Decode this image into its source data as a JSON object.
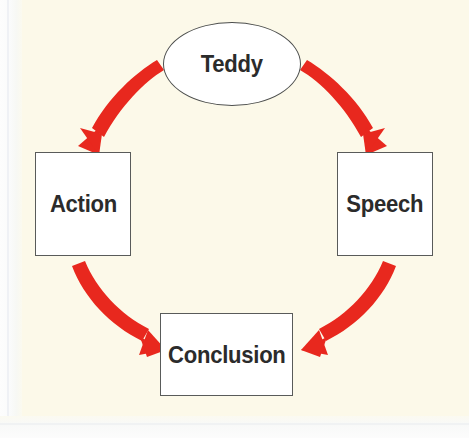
{
  "diagram": {
    "background_color": "#fcf9e9",
    "arrow_color": "#e8281e",
    "node_border_color": "#595b5a",
    "node_fill_color": "#ffffff",
    "label_color": "#2b2b2b",
    "nodes": [
      {
        "id": "teddy",
        "label": "Teddy",
        "shape": "ellipse",
        "x": 163,
        "y": 22,
        "w": 138,
        "h": 84
      },
      {
        "id": "action",
        "label": "Action",
        "shape": "rectangle",
        "x": 35,
        "y": 152,
        "w": 96,
        "h": 104
      },
      {
        "id": "speech",
        "label": "Speech",
        "shape": "rectangle",
        "x": 337,
        "y": 152,
        "w": 96,
        "h": 104
      },
      {
        "id": "conclusion",
        "label": "Conclusion",
        "shape": "rectangle",
        "x": 160,
        "y": 313,
        "w": 133,
        "h": 83
      }
    ],
    "edges": [
      {
        "id": "teddy-to-action",
        "from": "Teddy",
        "to": "Action",
        "style": "curved-arrow",
        "color": "#e8281e"
      },
      {
        "id": "teddy-to-speech",
        "from": "Teddy",
        "to": "Speech",
        "style": "curved-arrow",
        "color": "#e8281e"
      },
      {
        "id": "action-to-conclusion",
        "from": "Action",
        "to": "Conclusion",
        "style": "curved-arrow",
        "color": "#e8281e"
      },
      {
        "id": "speech-to-conclusion",
        "from": "Speech",
        "to": "Conclusion",
        "style": "curved-arrow",
        "color": "#e8281e"
      }
    ]
  }
}
